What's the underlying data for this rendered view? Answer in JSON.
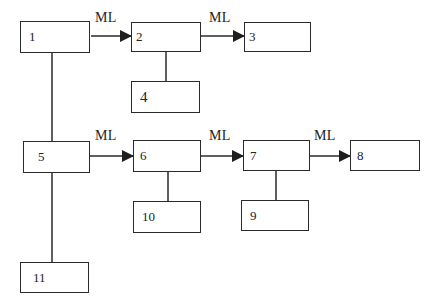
{
  "diagram": {
    "edge_label": "ML",
    "nodes": [
      {
        "id": "1",
        "label": "1",
        "x": 20,
        "y": 21,
        "w": 70,
        "h": 32
      },
      {
        "id": "2",
        "label": "2",
        "x": 131,
        "y": 22,
        "w": 70,
        "h": 30
      },
      {
        "id": "3",
        "label": "3",
        "x": 244,
        "y": 22,
        "w": 67,
        "h": 30
      },
      {
        "id": "4",
        "label": "4",
        "x": 131,
        "y": 81,
        "w": 69,
        "h": 32
      },
      {
        "id": "5",
        "label": "5",
        "x": 23,
        "y": 141,
        "w": 67,
        "h": 32
      },
      {
        "id": "6",
        "label": "6",
        "x": 133,
        "y": 140,
        "w": 68,
        "h": 32
      },
      {
        "id": "7",
        "label": "7",
        "x": 243,
        "y": 140,
        "w": 67,
        "h": 31
      },
      {
        "id": "8",
        "label": "8",
        "x": 350,
        "y": 140,
        "w": 70,
        "h": 31
      },
      {
        "id": "9",
        "label": "9",
        "x": 241,
        "y": 200,
        "w": 68,
        "h": 31
      },
      {
        "id": "10",
        "label": "10",
        "x": 133,
        "y": 201,
        "w": 68,
        "h": 32
      },
      {
        "id": "11",
        "label": "11",
        "x": 20,
        "y": 262,
        "w": 69,
        "h": 31
      }
    ],
    "arrows": [
      {
        "from": "1",
        "to": "2",
        "label": "ML"
      },
      {
        "from": "2",
        "to": "3",
        "label": "ML"
      },
      {
        "from": "5",
        "to": "6",
        "label": "ML"
      },
      {
        "from": "6",
        "to": "7",
        "label": "ML"
      },
      {
        "from": "7",
        "to": "8",
        "label": "ML"
      }
    ],
    "links": [
      {
        "from": "1",
        "to": "5"
      },
      {
        "from": "5",
        "to": "11"
      },
      {
        "from": "2",
        "to": "4"
      },
      {
        "from": "6",
        "to": "10"
      },
      {
        "from": "7",
        "to": "9"
      }
    ]
  }
}
